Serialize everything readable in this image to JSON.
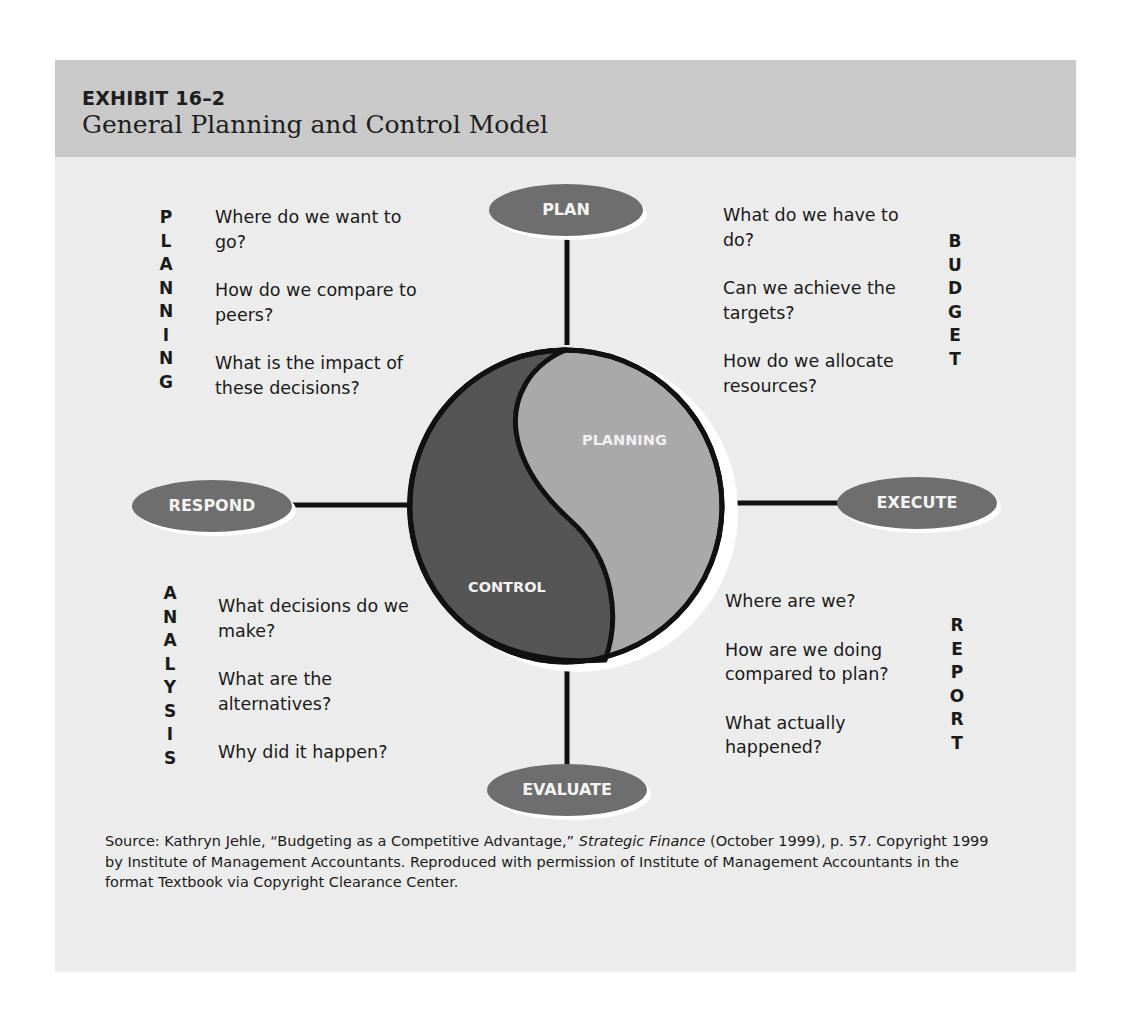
{
  "exhibit": {
    "number": "EXHIBIT 16–2",
    "title": "General Planning and Control Model"
  },
  "colors": {
    "header_band": "#c9c9c9",
    "panel_bg": "#ececec",
    "node_fill": "#6e6e6e",
    "control_fill": "#555555",
    "planning_fill": "#a9a9a9",
    "outline": "#111111",
    "node_text": "#f4f4f4"
  },
  "nodes": {
    "plan": "PLAN",
    "execute": "EXECUTE",
    "evaluate": "EVALUATE",
    "respond": "RESPOND"
  },
  "circle": {
    "planning_label": "PLANNING",
    "control_label": "CONTROL"
  },
  "quadrants": {
    "planning": {
      "vertical_word": [
        "P",
        "L",
        "A",
        "N",
        "N",
        "I",
        "N",
        "G"
      ],
      "questions": [
        "Where do we want to go?",
        "How do we compare to peers?",
        "What is the impact of these decisions?"
      ]
    },
    "budget": {
      "vertical_word": [
        "B",
        "U",
        "D",
        "G",
        "E",
        "T"
      ],
      "questions": [
        "What do we have to do?",
        "Can we achieve the targets?",
        "How do we allocate resources?"
      ]
    },
    "analysis": {
      "vertical_word": [
        "A",
        "N",
        "A",
        "L",
        "Y",
        "S",
        "I",
        "S"
      ],
      "questions": [
        "What decisions do we make?",
        "What are the alternatives?",
        "Why did it happen?"
      ]
    },
    "report": {
      "vertical_word": [
        "R",
        "E",
        "P",
        "O",
        "R",
        "T"
      ],
      "questions": [
        "Where are we?",
        "How are we doing compared to plan?",
        "What actually happened?"
      ]
    }
  },
  "source": {
    "label": "Source:",
    "text_before_italic": " Kathryn Jehle, “Budgeting as a Competitive Advantage,” ",
    "italic": "Strategic Finance",
    "text_after_italic": " (October 1999), p. 57. Copyright 1999 by Institute of Management Accountants. Reproduced with permission of Institute of Management Accountants in the format Textbook via Copyright Clearance Center."
  }
}
